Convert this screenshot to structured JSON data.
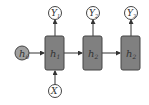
{
  "diagram": {
    "type": "rnn-unrolled",
    "initial_state": {
      "label": "h",
      "sub": "0"
    },
    "input": {
      "label": "X",
      "sub": ""
    },
    "hidden": [
      {
        "label": "h",
        "sub": "1"
      },
      {
        "label": "h",
        "sub": "2"
      },
      {
        "label": "h",
        "sub": "2"
      }
    ],
    "outputs": [
      {
        "label": "Y",
        "sub": "1"
      },
      {
        "label": "Y",
        "sub": "2"
      },
      {
        "label": "Y",
        "sub": "3"
      }
    ],
    "colors": {
      "box_fill": "#808080",
      "box_stroke": "#444444",
      "h0_fill": "#a0a0a0",
      "circle_fill": "#ffffff",
      "line": "#333333"
    }
  }
}
